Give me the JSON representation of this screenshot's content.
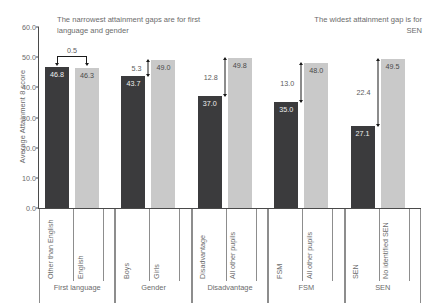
{
  "chart_data": {
    "type": "bar",
    "title": "",
    "xlabel": "",
    "ylabel": "Average Attainment 8 score",
    "ylim": [
      0.0,
      60.0
    ],
    "ytick_values": [
      "60.0",
      "50.0",
      "40.0",
      "30.0",
      "20.0",
      "10.0",
      "0.0"
    ],
    "grid": false,
    "legend": "none",
    "categories": [
      "Other than English",
      "English",
      "Boys",
      "Girls",
      "Disadvantage",
      "All other pupils",
      "FSM",
      "All other pupils",
      "SEN",
      "No identified SEN"
    ],
    "values": [
      46.8,
      46.3,
      43.7,
      49.0,
      37.0,
      49.8,
      35.0,
      48.0,
      27.1,
      49.5
    ],
    "groups": [
      {
        "name": "First language",
        "gap": "0.5",
        "gap_style": "bracket",
        "bars": [
          {
            "label": "Other than English",
            "value": 46.8,
            "value_text": "46.8",
            "tone": "dark"
          },
          {
            "label": "English",
            "value": 46.3,
            "value_text": "46.3",
            "tone": "light"
          }
        ]
      },
      {
        "name": "Gender",
        "gap": "5.3",
        "gap_style": "vertical",
        "bars": [
          {
            "label": "Boys",
            "value": 43.7,
            "value_text": "43.7",
            "tone": "dark"
          },
          {
            "label": "Girls",
            "value": 49.0,
            "value_text": "49.0",
            "tone": "light"
          }
        ]
      },
      {
        "name": "Disadvantage",
        "gap": "12.8",
        "gap_style": "vertical",
        "bars": [
          {
            "label": "Disadvantage",
            "value": 37.0,
            "value_text": "37.0",
            "tone": "dark"
          },
          {
            "label": "All other pupils",
            "value": 49.8,
            "value_text": "49.8",
            "tone": "light"
          }
        ]
      },
      {
        "name": "FSM",
        "gap": "13.0",
        "gap_style": "vertical",
        "bars": [
          {
            "label": "FSM",
            "value": 35.0,
            "value_text": "35.0",
            "tone": "dark"
          },
          {
            "label": "All other pupils",
            "value": 48.0,
            "value_text": "48.0",
            "tone": "light"
          }
        ]
      },
      {
        "name": "SEN",
        "gap": "22.4",
        "gap_style": "vertical",
        "bars": [
          {
            "label": "SEN",
            "value": 27.1,
            "value_text": "27.1",
            "tone": "dark"
          },
          {
            "label": "No identified SEN",
            "value": 49.5,
            "value_text": "49.5",
            "tone": "light"
          }
        ]
      }
    ],
    "annotations": [
      {
        "id": "left",
        "text": "The narrowest attainment gaps are for first language and gender"
      },
      {
        "id": "right",
        "text": "The widest attainment gap is for SEN"
      }
    ],
    "colors": {
      "bar_dark": "#3b3b3d",
      "bar_light": "#c9c9c9",
      "axis": "#4a4a4a",
      "text": "#6b6b6b",
      "annotation_arrow": "#1b1b1b",
      "background": "#ffffff"
    }
  }
}
